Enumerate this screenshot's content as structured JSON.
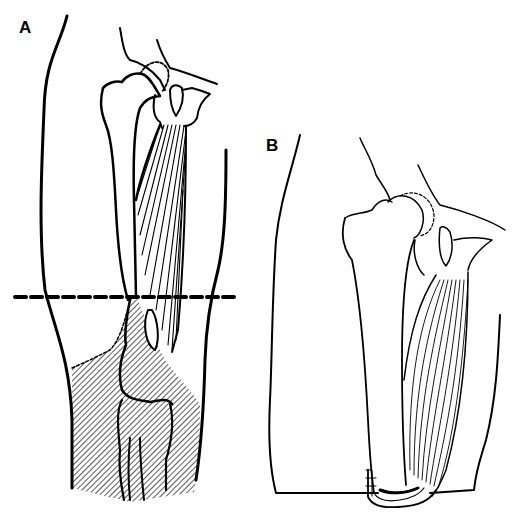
{
  "figure": {
    "panels": [
      {
        "label": "A",
        "description": "Anterior view of thigh and knee with dashed amputation line above the knee; hatched region below line indicates resected tissue; adductor muscles shown between pelvis and femur"
      },
      {
        "label": "B",
        "description": "Residual limb after above-knee amputation showing adductor muscle wrapped around distal femur end (myodesis)"
      }
    ],
    "colors": {
      "line": "#000000",
      "background": "#ffffff"
    }
  }
}
